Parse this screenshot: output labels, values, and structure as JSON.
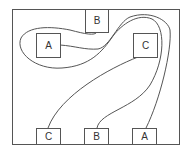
{
  "diagram": {
    "title": "",
    "frame": {
      "x": 12,
      "y": 9,
      "w": 167,
      "h": 135
    },
    "line_color": "#555555",
    "nodes": [
      {
        "id": "top-A",
        "label": "A",
        "x": 36,
        "y": 33,
        "w": 24,
        "h": 24
      },
      {
        "id": "top-B",
        "label": "B",
        "x": 85,
        "y": 9,
        "w": 23,
        "h": 23
      },
      {
        "id": "top-C",
        "label": "C",
        "x": 133,
        "y": 33,
        "w": 24,
        "h": 24
      },
      {
        "id": "bottom-C",
        "label": "C",
        "x": 36,
        "y": 128,
        "w": 24,
        "h": 16
      },
      {
        "id": "bottom-B",
        "label": "B",
        "x": 84,
        "y": 128,
        "w": 24,
        "h": 16
      },
      {
        "id": "bottom-A",
        "label": "A",
        "x": 132,
        "y": 128,
        "w": 24,
        "h": 16
      }
    ],
    "connections": [
      {
        "from": "top-A",
        "to": "bottom-A"
      },
      {
        "from": "top-B",
        "to": "bottom-B"
      },
      {
        "from": "top-C",
        "to": "bottom-C"
      }
    ]
  }
}
